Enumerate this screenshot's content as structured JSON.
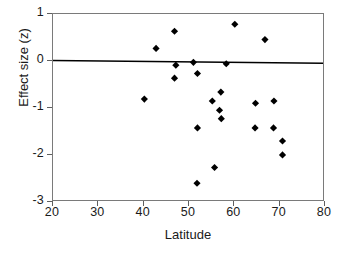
{
  "chart_data": {
    "type": "scatter",
    "title": "",
    "xlabel": "Latitude",
    "ylabel": "Effect size (z)",
    "xlim": [
      20,
      80
    ],
    "ylim": [
      -3,
      1
    ],
    "xticks": [
      20,
      30,
      40,
      50,
      60,
      70,
      80
    ],
    "yticks": [
      1,
      0,
      -1,
      -2,
      -3
    ],
    "xtick_labels": [
      "20",
      "30",
      "40",
      "50",
      "60",
      "70",
      "80"
    ],
    "ytick_labels": [
      "1",
      "0",
      "-1",
      "-2",
      "-3"
    ],
    "grid": false,
    "legend": null,
    "marker": {
      "shape": "diamond",
      "color": "#000000",
      "size": 5
    },
    "points": [
      {
        "x": 40.3,
        "y": -0.83
      },
      {
        "x": 42.9,
        "y": 0.26
      },
      {
        "x": 47.0,
        "y": 0.63
      },
      {
        "x": 47.3,
        "y": -0.1
      },
      {
        "x": 47.0,
        "y": -0.38
      },
      {
        "x": 51.2,
        "y": -0.04
      },
      {
        "x": 52.1,
        "y": -0.28
      },
      {
        "x": 52.1,
        "y": -1.45
      },
      {
        "x": 52.0,
        "y": -2.64
      },
      {
        "x": 55.4,
        "y": -0.87
      },
      {
        "x": 55.9,
        "y": -2.3
      },
      {
        "x": 57.0,
        "y": -1.07
      },
      {
        "x": 57.4,
        "y": -1.25
      },
      {
        "x": 57.3,
        "y": -0.68
      },
      {
        "x": 58.5,
        "y": -0.07
      },
      {
        "x": 60.4,
        "y": 0.78
      },
      {
        "x": 64.9,
        "y": -1.45
      },
      {
        "x": 65.0,
        "y": -0.92
      },
      {
        "x": 67.1,
        "y": 0.45
      },
      {
        "x": 69.0,
        "y": -1.45
      },
      {
        "x": 69.1,
        "y": -0.87
      },
      {
        "x": 71.0,
        "y": -1.73
      },
      {
        "x": 71.0,
        "y": -2.03
      }
    ],
    "reference_line": {
      "name": "regression-line",
      "x_start": 20,
      "y_start": 0.0,
      "x_end": 80,
      "y_end": -0.06,
      "color": "#000000",
      "width": 1.6
    },
    "frame_color": "#7a7a7a",
    "background": "#ffffff"
  }
}
